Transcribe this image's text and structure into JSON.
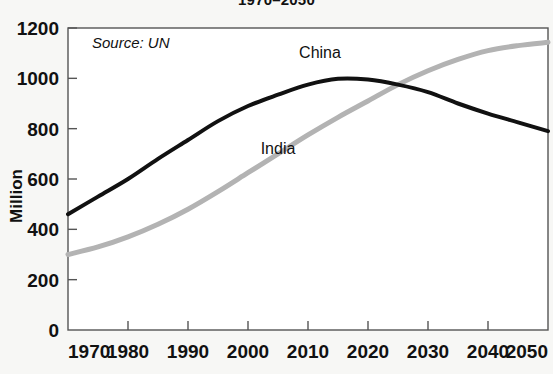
{
  "chart_data": {
    "type": "line",
    "title": "1970–2050",
    "xlabel": "",
    "ylabel": "Million",
    "xlim": [
      1970,
      2050
    ],
    "ylim": [
      0,
      1200
    ],
    "ytick_step": 200,
    "xtick_step": 10,
    "grid": false,
    "legend": "inline-labels",
    "annotations": [
      {
        "name": "source",
        "text": "Source: UN",
        "x": 1974,
        "y": 1120
      }
    ],
    "xticks": [
      1970,
      1980,
      1990,
      2000,
      2010,
      2020,
      2030,
      2040,
      2050
    ],
    "yticks": [
      0,
      200,
      400,
      600,
      800,
      1000,
      1200
    ],
    "x": [
      1970,
      1975,
      1980,
      1985,
      1990,
      1995,
      2000,
      2005,
      2010,
      2015,
      2020,
      2025,
      2030,
      2035,
      2040,
      2045,
      2050
    ],
    "series": [
      {
        "name": "China",
        "color": "#111111",
        "width": 4,
        "label_x": 2012,
        "label_y": 1080,
        "values": [
          460,
          530,
          600,
          680,
          755,
          830,
          890,
          935,
          975,
          998,
          995,
          975,
          945,
          900,
          860,
          825,
          790
        ]
      },
      {
        "name": "India",
        "color": "#b3b3b3",
        "width": 5,
        "label_x": 2005,
        "label_y": 700,
        "values": [
          300,
          330,
          370,
          420,
          480,
          550,
          625,
          700,
          775,
          845,
          910,
          975,
          1030,
          1075,
          1110,
          1130,
          1143
        ]
      }
    ]
  }
}
